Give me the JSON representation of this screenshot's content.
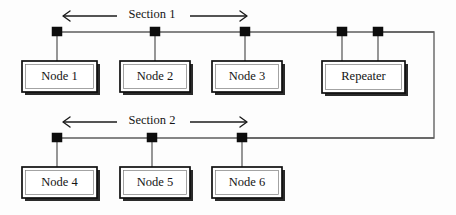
{
  "diagram": {
    "canvas": {
      "width": 456,
      "height": 215,
      "background": "#fdfdfd"
    },
    "colors": {
      "bus": "#5d5d5d",
      "tap": "#0d0d0d",
      "box_border": "#0f0f0f",
      "box_fill": "#ffffff",
      "text": "#141414",
      "arrow": "#1b1b1b",
      "link": "#6d6d6d"
    },
    "sections": [
      {
        "id": "section-1",
        "label": "Section 1",
        "label_x": 152,
        "label_y": 14,
        "arrow_left_x": 63,
        "arrow_right_x": 247,
        "arrow_y": 16,
        "bus_y": 32,
        "bus_x1": 57,
        "bus_x2": 434
      },
      {
        "id": "section-2",
        "label": "Section 2",
        "label_x": 152,
        "label_y": 120,
        "arrow_left_x": 63,
        "arrow_right_x": 247,
        "arrow_y": 122,
        "bus_y": 138,
        "bus_x1": 57,
        "bus_x2": 434
      }
    ],
    "taps": [
      {
        "id": "tap-node-1",
        "x": 57,
        "y": 32
      },
      {
        "id": "tap-node-2",
        "x": 155,
        "y": 32
      },
      {
        "id": "tap-node-3",
        "x": 245,
        "y": 32
      },
      {
        "id": "tap-repeater-left",
        "x": 342,
        "y": 32
      },
      {
        "id": "tap-repeater-right",
        "x": 378,
        "y": 32
      },
      {
        "id": "tap-node-4",
        "x": 57,
        "y": 138
      },
      {
        "id": "tap-node-5",
        "x": 152,
        "y": 138
      },
      {
        "id": "tap-node-6",
        "x": 242,
        "y": 138
      }
    ],
    "boxes": [
      {
        "id": "node-1",
        "label": "Node 1",
        "x": 22,
        "y": 61,
        "w": 75,
        "h": 31,
        "tap_x": 57,
        "bus_y": 32
      },
      {
        "id": "node-2",
        "label": "Node 2",
        "x": 120,
        "y": 61,
        "w": 70,
        "h": 31,
        "tap_x": 155,
        "bus_y": 32
      },
      {
        "id": "node-3",
        "label": "Node 3",
        "x": 212,
        "y": 61,
        "w": 70,
        "h": 31,
        "tap_x": 245,
        "bus_y": 32
      },
      {
        "id": "repeater",
        "label": "Repeater",
        "x": 322,
        "y": 61,
        "w": 83,
        "h": 32,
        "tap_x": 342,
        "bus_y": 32
      },
      {
        "id": "node-4",
        "label": "Node 4",
        "x": 22,
        "y": 167,
        "w": 75,
        "h": 31,
        "tap_x": 57,
        "bus_y": 138
      },
      {
        "id": "node-5",
        "label": "Node 5",
        "x": 120,
        "y": 167,
        "w": 70,
        "h": 31,
        "tap_x": 152,
        "bus_y": 138
      },
      {
        "id": "node-6",
        "label": "Node 6",
        "x": 212,
        "y": 167,
        "w": 70,
        "h": 31,
        "tap_x": 242,
        "bus_y": 138
      }
    ],
    "extra_drops": [
      {
        "id": "drop-repeater-right",
        "x": 378,
        "y1": 32,
        "y2": 61
      }
    ],
    "link": {
      "id": "repeater-interconnect",
      "description": "Wire from right repeater tap around the right edge down to Section 2 bus",
      "points": "378,32 434,32 434,138 242,138"
    }
  }
}
